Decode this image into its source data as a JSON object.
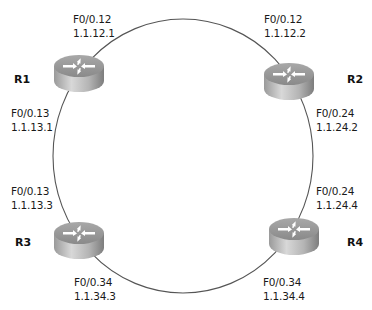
{
  "diagram": {
    "type": "ring-topology",
    "link_color": "#555555",
    "routers": [
      {
        "name": "R1",
        "icon": "router-icon"
      },
      {
        "name": "R2",
        "icon": "router-icon"
      },
      {
        "name": "R3",
        "icon": "router-icon"
      },
      {
        "name": "R4",
        "icon": "router-icon"
      }
    ],
    "links": [
      {
        "from": "R1",
        "to": "R2",
        "a": {
          "iface": "F0/0.12",
          "ip": "1.1.12.1"
        },
        "b": {
          "iface": "F0/0.12",
          "ip": "1.1.12.2"
        }
      },
      {
        "from": "R1",
        "to": "R3",
        "a": {
          "iface": "F0/0.13",
          "ip": "1.1.13.1"
        },
        "b": {
          "iface": "F0/0.13",
          "ip": "1.1.13.3"
        }
      },
      {
        "from": "R2",
        "to": "R4",
        "a": {
          "iface": "F0/0.24",
          "ip": "1.1.24.2"
        },
        "b": {
          "iface": "F0/0.24",
          "ip": "1.1.24.4"
        }
      },
      {
        "from": "R3",
        "to": "R4",
        "a": {
          "iface": "F0/0.34",
          "ip": "1.1.34.3"
        },
        "b": {
          "iface": "F0/0.34",
          "ip": "1.1.34.4"
        }
      }
    ]
  }
}
